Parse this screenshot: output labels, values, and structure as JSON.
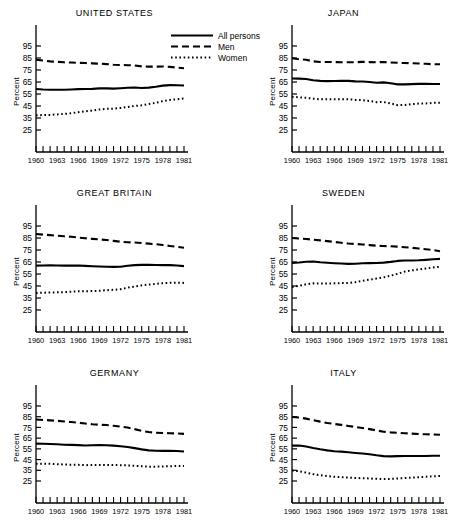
{
  "figure": {
    "ylabel": "Percent",
    "y_ticks": [
      25,
      35,
      45,
      55,
      65,
      75,
      85,
      95
    ],
    "x_ticks_labeled": [
      1960,
      1963,
      1966,
      1969,
      1972,
      1975,
      1978,
      1981
    ],
    "colors": {
      "ink": "#000000",
      "background": "#ffffff"
    }
  },
  "legend": {
    "position": "top-center",
    "entries": [
      {
        "label": "All persons",
        "style": "solid",
        "key_icon": "solid-line-icon"
      },
      {
        "label": "Men",
        "style": "dashed",
        "key_icon": "dashed-line-icon"
      },
      {
        "label": "Women",
        "style": "dotted",
        "key_icon": "dotted-line-icon"
      }
    ]
  },
  "chart_data": [
    {
      "type": "line",
      "title": "UNITED STATES",
      "xlabel": "",
      "ylabel": "Percent",
      "xlim": [
        1960,
        1981
      ],
      "ylim": [
        20,
        105
      ],
      "yticks": [
        25,
        35,
        45,
        55,
        65,
        75,
        85,
        95
      ],
      "xticks": [
        1960,
        1963,
        1966,
        1969,
        1972,
        1975,
        1978,
        1981
      ],
      "grid": false,
      "x": [
        1960,
        1961,
        1962,
        1963,
        1964,
        1965,
        1966,
        1967,
        1968,
        1969,
        1970,
        1971,
        1972,
        1973,
        1974,
        1975,
        1976,
        1977,
        1978,
        1979,
        1980,
        1981
      ],
      "series": [
        {
          "name": "All persons",
          "style": "solid",
          "values": [
            59.2,
            58.8,
            58.6,
            58.6,
            58.6,
            58.8,
            59.1,
            59.2,
            59.3,
            59.7,
            59.7,
            59.5,
            59.8,
            60.2,
            60.4,
            60.0,
            60.3,
            61.0,
            62.0,
            62.4,
            62.3,
            62.1
          ]
        },
        {
          "name": "Men",
          "style": "dashed",
          "values": [
            83.5,
            82.9,
            82.2,
            81.8,
            81.4,
            81.2,
            81.0,
            80.8,
            80.5,
            80.3,
            79.9,
            79.4,
            79.2,
            79.0,
            78.8,
            78.0,
            77.8,
            77.8,
            77.9,
            77.6,
            77.0,
            76.4
          ]
        },
        {
          "name": "Women",
          "style": "dotted",
          "values": [
            37.2,
            37.5,
            37.6,
            38.0,
            38.4,
            39.0,
            39.8,
            40.6,
            41.3,
            42.1,
            42.6,
            42.8,
            43.4,
            44.2,
            45.0,
            45.6,
            46.6,
            47.6,
            49.1,
            50.1,
            50.6,
            51.2
          ]
        }
      ]
    },
    {
      "type": "line",
      "title": "JAPAN",
      "xlabel": "",
      "ylabel": "Percent",
      "xlim": [
        1960,
        1981
      ],
      "ylim": [
        20,
        105
      ],
      "yticks": [
        25,
        35,
        45,
        55,
        65,
        75,
        85,
        95
      ],
      "xticks": [
        1960,
        1963,
        1966,
        1969,
        1972,
        1975,
        1978,
        1981
      ],
      "grid": false,
      "x": [
        1960,
        1961,
        1962,
        1963,
        1964,
        1965,
        1966,
        1967,
        1968,
        1969,
        1970,
        1971,
        1972,
        1973,
        1974,
        1975,
        1976,
        1977,
        1978,
        1979,
        1980,
        1981
      ],
      "series": [
        {
          "name": "All persons",
          "style": "solid",
          "values": [
            67.9,
            67.8,
            67.5,
            66.4,
            65.9,
            65.7,
            65.8,
            65.9,
            65.9,
            65.5,
            65.4,
            65.0,
            64.4,
            64.7,
            63.9,
            63.0,
            63.0,
            63.2,
            63.4,
            63.4,
            63.3,
            63.3
          ]
        },
        {
          "name": "Men",
          "style": "dashed",
          "values": [
            84.8,
            84.0,
            83.5,
            82.2,
            81.7,
            81.7,
            81.6,
            81.5,
            81.5,
            81.4,
            81.8,
            81.6,
            81.5,
            81.6,
            81.2,
            81.0,
            80.8,
            80.6,
            80.4,
            80.2,
            79.8,
            79.8
          ]
        },
        {
          "name": "Women",
          "style": "dotted",
          "values": [
            52.7,
            52.2,
            51.8,
            51.1,
            50.6,
            50.6,
            50.6,
            50.7,
            50.6,
            50.1,
            49.9,
            49.2,
            48.2,
            48.3,
            47.2,
            45.7,
            45.8,
            46.6,
            47.0,
            47.1,
            47.6,
            47.7
          ]
        }
      ]
    },
    {
      "type": "line",
      "title": "GREAT BRITAIN",
      "xlabel": "",
      "ylabel": "Percent",
      "xlim": [
        1960,
        1981
      ],
      "ylim": [
        20,
        105
      ],
      "yticks": [
        25,
        35,
        45,
        55,
        65,
        75,
        85,
        95
      ],
      "xticks": [
        1960,
        1963,
        1966,
        1969,
        1972,
        1975,
        1978,
        1981
      ],
      "grid": false,
      "x": [
        1960,
        1961,
        1962,
        1963,
        1964,
        1965,
        1966,
        1967,
        1968,
        1969,
        1970,
        1971,
        1972,
        1973,
        1974,
        1975,
        1976,
        1977,
        1978,
        1979,
        1980,
        1981
      ],
      "series": [
        {
          "name": "All persons",
          "style": "solid",
          "values": [
            62.0,
            62.1,
            62.2,
            62.1,
            62.0,
            62.0,
            62.1,
            61.8,
            61.5,
            61.3,
            61.0,
            60.9,
            61.0,
            61.9,
            62.4,
            62.6,
            62.6,
            62.5,
            62.4,
            62.4,
            62.1,
            61.6
          ]
        },
        {
          "name": "Men",
          "style": "dashed",
          "values": [
            88.3,
            87.8,
            87.4,
            86.9,
            86.4,
            86.0,
            85.4,
            84.8,
            84.3,
            83.8,
            83.3,
            82.6,
            81.9,
            81.5,
            81.2,
            80.8,
            80.3,
            79.8,
            79.1,
            78.4,
            77.6,
            76.9
          ]
        },
        {
          "name": "Women",
          "style": "dotted",
          "values": [
            39.2,
            39.4,
            39.6,
            39.7,
            39.9,
            40.2,
            40.6,
            40.6,
            40.8,
            41.0,
            41.5,
            41.8,
            42.3,
            43.6,
            44.6,
            45.5,
            46.2,
            46.8,
            47.3,
            47.7,
            47.8,
            47.6
          ]
        }
      ]
    },
    {
      "type": "line",
      "title": "SWEDEN",
      "xlabel": "",
      "ylabel": "Percent",
      "xlim": [
        1960,
        1981
      ],
      "ylim": [
        20,
        105
      ],
      "yticks": [
        25,
        35,
        45,
        55,
        65,
        75,
        85,
        95
      ],
      "xticks": [
        1960,
        1963,
        1966,
        1969,
        1972,
        1975,
        1978,
        1981
      ],
      "grid": false,
      "x": [
        1960,
        1961,
        1962,
        1963,
        1964,
        1965,
        1966,
        1967,
        1968,
        1969,
        1970,
        1971,
        1972,
        1973,
        1974,
        1975,
        1976,
        1977,
        1978,
        1979,
        1980,
        1981
      ],
      "series": [
        {
          "name": "All persons",
          "style": "solid",
          "values": [
            64.2,
            64.6,
            65.2,
            65.4,
            64.8,
            64.4,
            64.0,
            63.7,
            63.4,
            63.6,
            64.0,
            64.1,
            64.2,
            64.5,
            65.1,
            65.9,
            66.3,
            66.2,
            66.4,
            66.8,
            67.3,
            67.6
          ]
        },
        {
          "name": "Men",
          "style": "dashed",
          "values": [
            85.0,
            84.6,
            84.2,
            83.6,
            83.0,
            82.4,
            81.7,
            81.0,
            80.4,
            80.0,
            79.6,
            79.1,
            78.6,
            78.3,
            78.1,
            77.8,
            77.3,
            76.8,
            76.2,
            75.6,
            75.0,
            74.0
          ]
        },
        {
          "name": "Women",
          "style": "dotted",
          "values": [
            44.2,
            45.2,
            46.4,
            47.2,
            47.0,
            47.0,
            47.2,
            47.4,
            47.5,
            48.2,
            49.4,
            50.3,
            51.2,
            52.2,
            53.6,
            55.2,
            57.0,
            58.0,
            58.8,
            59.6,
            60.4,
            61.0
          ]
        }
      ]
    },
    {
      "type": "line",
      "title": "GERMANY",
      "xlabel": "",
      "ylabel": "Percent",
      "xlim": [
        1960,
        1981
      ],
      "ylim": [
        20,
        105
      ],
      "yticks": [
        25,
        35,
        45,
        55,
        65,
        75,
        85,
        95
      ],
      "xticks": [
        1960,
        1963,
        1966,
        1969,
        1972,
        1975,
        1978,
        1981
      ],
      "grid": false,
      "x": [
        1960,
        1961,
        1962,
        1963,
        1964,
        1965,
        1966,
        1967,
        1968,
        1969,
        1970,
        1971,
        1972,
        1973,
        1974,
        1975,
        1976,
        1977,
        1978,
        1979,
        1980,
        1981
      ],
      "series": [
        {
          "name": "All persons",
          "style": "solid",
          "values": [
            59.9,
            59.8,
            59.6,
            59.3,
            58.9,
            58.7,
            58.5,
            58.2,
            58.3,
            58.5,
            58.4,
            58.0,
            57.4,
            56.8,
            55.7,
            54.5,
            53.6,
            53.2,
            53.1,
            53.1,
            53.0,
            52.6
          ]
        },
        {
          "name": "Men",
          "style": "dashed",
          "values": [
            82.4,
            82.0,
            81.6,
            81.2,
            80.6,
            80.0,
            79.4,
            78.6,
            77.9,
            77.5,
            77.2,
            76.5,
            75.8,
            74.9,
            73.4,
            71.8,
            70.7,
            70.0,
            69.8,
            69.6,
            69.4,
            69.0
          ]
        },
        {
          "name": "Women",
          "style": "dotted",
          "values": [
            41.0,
            41.1,
            41.0,
            40.7,
            40.4,
            40.2,
            40.1,
            39.8,
            39.9,
            39.9,
            39.9,
            39.9,
            39.8,
            39.6,
            39.2,
            38.8,
            38.4,
            38.4,
            38.6,
            38.8,
            39.0,
            39.0
          ]
        }
      ]
    },
    {
      "type": "line",
      "title": "ITALY",
      "xlabel": "",
      "ylabel": "Percent",
      "xlim": [
        1960,
        1981
      ],
      "ylim": [
        20,
        105
      ],
      "yticks": [
        25,
        35,
        45,
        55,
        65,
        75,
        85,
        95
      ],
      "xticks": [
        1960,
        1963,
        1966,
        1969,
        1972,
        1975,
        1978,
        1981
      ],
      "grid": false,
      "x": [
        1960,
        1961,
        1962,
        1963,
        1964,
        1965,
        1966,
        1967,
        1968,
        1969,
        1970,
        1971,
        1972,
        1973,
        1974,
        1975,
        1976,
        1977,
        1978,
        1979,
        1980,
        1981
      ],
      "series": [
        {
          "name": "All persons",
          "style": "solid",
          "values": [
            58.0,
            58.2,
            57.2,
            55.8,
            54.6,
            53.6,
            52.8,
            52.4,
            51.8,
            51.2,
            50.6,
            50.0,
            49.0,
            48.2,
            48.0,
            48.2,
            48.3,
            48.3,
            48.3,
            48.4,
            48.5,
            48.6
          ]
        },
        {
          "name": "Men",
          "style": "dashed",
          "values": [
            84.8,
            84.2,
            83.2,
            81.8,
            80.4,
            79.2,
            78.2,
            77.4,
            76.4,
            75.4,
            74.4,
            73.4,
            72.2,
            71.0,
            70.4,
            70.0,
            69.6,
            69.2,
            68.8,
            68.6,
            68.4,
            68.2
          ]
        },
        {
          "name": "Women",
          "style": "dotted",
          "values": [
            34.8,
            34.2,
            32.8,
            31.4,
            30.4,
            29.6,
            29.0,
            28.6,
            28.2,
            27.8,
            27.6,
            27.4,
            27.0,
            26.8,
            27.0,
            27.4,
            27.8,
            28.2,
            28.6,
            29.0,
            29.4,
            29.6
          ]
        }
      ]
    }
  ]
}
